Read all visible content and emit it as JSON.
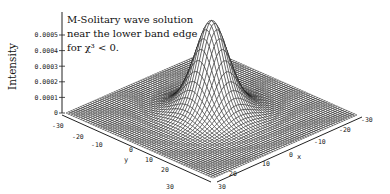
{
  "chart_data": {
    "type": "surface",
    "title_lines": [
      "M-Solitary wave solution",
      "near the lower band edge",
      "for χ³ < 0."
    ],
    "xlabel": "x",
    "ylabel": "y",
    "zlabel": "Intensity",
    "xlim": [
      -30,
      30
    ],
    "ylim": [
      -30,
      30
    ],
    "zlim": [
      0,
      0.0005
    ],
    "x_ticks": [
      "-30",
      "-20",
      "-10",
      "0",
      "10",
      "20",
      "30"
    ],
    "y_ticks": [
      "-30",
      "-20",
      "-10",
      "0",
      "10",
      "20",
      "30"
    ],
    "z_ticks": [
      "0",
      "0.0001",
      "0.0002",
      "0.0003",
      "0.0004",
      "0.0005"
    ],
    "surface": {
      "function": "peak * sech^2(sqrt(x^2+y^2)/width)",
      "peak": 0.0006,
      "width": 7,
      "center": [
        0,
        0
      ],
      "grid_lines_per_axis": 60
    },
    "colors": {
      "mesh": "#111111",
      "fill": "#ffffff",
      "axis": "#222222"
    }
  }
}
